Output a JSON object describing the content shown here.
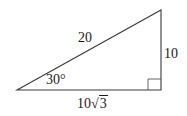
{
  "diagram": {
    "type": "right-triangle",
    "stroke_color": "#3a3a3a",
    "vertices": {
      "left": [
        17,
        90
      ],
      "top": [
        161,
        10
      ],
      "right_angle": [
        161,
        90
      ]
    },
    "labels": {
      "hypotenuse": "20",
      "opposite": "10",
      "adjacent_coefficient": "10",
      "adjacent_radical_symbol": "√",
      "adjacent_radicand": "3",
      "angle": "30°"
    }
  }
}
